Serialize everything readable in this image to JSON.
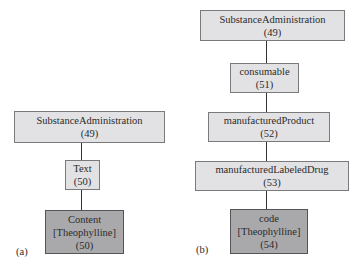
{
  "panels": [
    {
      "label": "(a)",
      "nodes": [
        {
          "lines": [
            "SubstanceAdministration",
            "(49)"
          ]
        },
        {
          "lines": [
            "Text",
            "(50)"
          ]
        },
        {
          "lines": [
            "Content",
            "[Theophylline]",
            "(50)"
          ],
          "highlight": true
        }
      ]
    },
    {
      "label": "(b)",
      "nodes": [
        {
          "lines": [
            "SubstanceAdministration",
            "(49)"
          ]
        },
        {
          "lines": [
            "consumable",
            "(51)"
          ]
        },
        {
          "lines": [
            "manufacturedProduct",
            "(52)"
          ]
        },
        {
          "lines": [
            "manufacturedLabeledDrug",
            "(53)"
          ]
        },
        {
          "lines": [
            "code",
            "[Theophylline]",
            "(54)"
          ],
          "highlight": true
        }
      ]
    }
  ],
  "colors": {
    "node_fill": "#e2e2e4",
    "highlight_fill": "#a9a9ab",
    "edge": "#333333"
  }
}
